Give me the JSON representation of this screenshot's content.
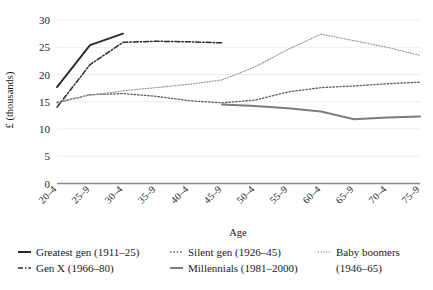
{
  "chart_data": {
    "type": "line",
    "title": "",
    "xlabel": "Age",
    "ylabel": "£ (thousands)",
    "ylim": [
      0,
      30
    ],
    "ytick_values": [
      0,
      5,
      10,
      15,
      20,
      25,
      30
    ],
    "ytick_labels": [
      "0",
      "5",
      "10",
      "15",
      "20",
      "25",
      "30"
    ],
    "grid": true,
    "grid_axis": "y",
    "legend_position": "bottom",
    "categories": [
      "20–4",
      "25–9",
      "30–4",
      "35–9",
      "40–4",
      "45–9",
      "50–4",
      "55–9",
      "60–4",
      "65–9",
      "70–4",
      "75–9"
    ],
    "series": [
      {
        "name": "Greatest gen (1911–25)",
        "style": "solid",
        "color": "#2b2b2b",
        "width": 1.9,
        "start_index": 0,
        "values": [
          17.7,
          25.4,
          27.5,
          null,
          null,
          null,
          null,
          null,
          null,
          null,
          null,
          null
        ]
      },
      {
        "name": "Gen X (1966–80)",
        "style": "dashdot",
        "color": "#2b2b2b",
        "width": 1.5,
        "start_index": 0,
        "values": [
          14.0,
          21.8,
          25.9,
          26.1,
          26.0,
          25.8,
          null,
          null,
          null,
          null,
          null,
          null
        ]
      },
      {
        "name": "Silent gen (1926–45)",
        "style": "dotted",
        "color": "#5e5e5e",
        "width": 1.3,
        "start_index": 0,
        "values": [
          14.8,
          16.3,
          16.5,
          16.0,
          15.2,
          14.8,
          15.3,
          16.8,
          17.6,
          17.9,
          18.3,
          18.6
        ]
      },
      {
        "name": "Baby boomers (1946–65)",
        "style": "fine-dotted",
        "color": "#9a9a9a",
        "width": 1.2,
        "start_index": 0,
        "values": [
          15.0,
          16.2,
          17.0,
          17.6,
          18.2,
          19.0,
          21.4,
          24.6,
          27.4,
          26.2,
          25.0,
          23.5
        ]
      },
      {
        "name": "Millennials (1981–2000)",
        "style": "solid",
        "color": "#7d7d7d",
        "width": 2.0,
        "start_index": 5,
        "values": [
          null,
          null,
          null,
          null,
          null,
          14.5,
          14.2,
          13.8,
          13.2,
          11.8,
          12.1,
          12.3
        ]
      }
    ]
  },
  "legend": {
    "entries": [
      {
        "label": "Greatest gen (1911–25)",
        "style": "solid",
        "color": "#2b2b2b"
      },
      {
        "label": "Silent gen (1926–45)",
        "style": "dotted",
        "color": "#5e5e5e"
      },
      {
        "label": "Baby boomers",
        "label2": "(1946–65)",
        "style": "fine-dotted",
        "color": "#9a9a9a"
      },
      {
        "label": "Gen X (1966–80)",
        "style": "dashdot",
        "color": "#2b2b2b"
      },
      {
        "label": "Millennials (1981–2000)",
        "style": "solid",
        "color": "#7d7d7d"
      }
    ]
  },
  "axes": {
    "y_title": "£ (thousands)",
    "x_title": "Age"
  }
}
